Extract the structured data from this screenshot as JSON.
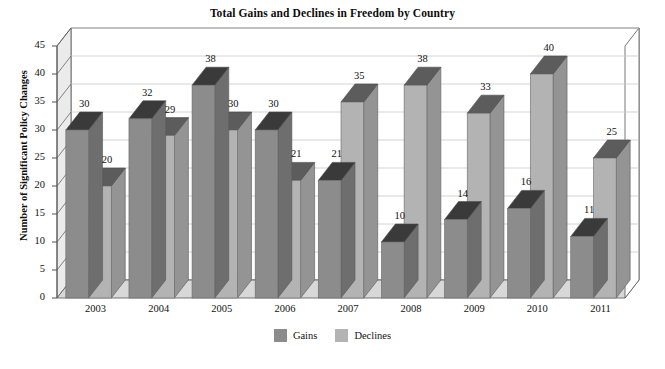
{
  "chart_data": {
    "type": "bar",
    "title": "Total Gains and Declines in Freedom by Country",
    "xlabel": "",
    "ylabel": "Number of Significant Policy Changes",
    "categories": [
      "2003",
      "2004",
      "2005",
      "2006",
      "2007",
      "2008",
      "2009",
      "2010",
      "2011"
    ],
    "series": [
      {
        "name": "Gains",
        "color": "#8c8c8c",
        "values": [
          30,
          32,
          38,
          30,
          21,
          10,
          14,
          16,
          11
        ]
      },
      {
        "name": "Declines",
        "color": "#b3b3b3",
        "values": [
          20,
          29,
          30,
          21,
          35,
          38,
          33,
          40,
          25
        ]
      }
    ],
    "ylim": [
      0,
      45
    ],
    "yticks": [
      0,
      5,
      10,
      15,
      20,
      25,
      30,
      35,
      40,
      45
    ],
    "ytick_labels": [
      "0",
      "5",
      "10",
      "15",
      "20",
      "25",
      "30",
      "35",
      "40",
      "45"
    ],
    "grid": true,
    "legend_position": "bottom",
    "style": "3d-column",
    "data_labels": true
  },
  "colors": {
    "gains": "#8c8c8c",
    "gains_top": "#3a3a3a",
    "gains_side": "#6e6e6e",
    "declines": "#b3b3b3",
    "declines_top": "#5c5c5c",
    "declines_side": "#949494",
    "grid": "#c8c8c8",
    "axis": "#555555",
    "wall": "#ebebeb",
    "floor": "#d8d8d8",
    "text": "#111111",
    "background": "#ffffff"
  },
  "legend": {
    "items": [
      {
        "label": "Gains"
      },
      {
        "label": "Declines"
      }
    ]
  }
}
